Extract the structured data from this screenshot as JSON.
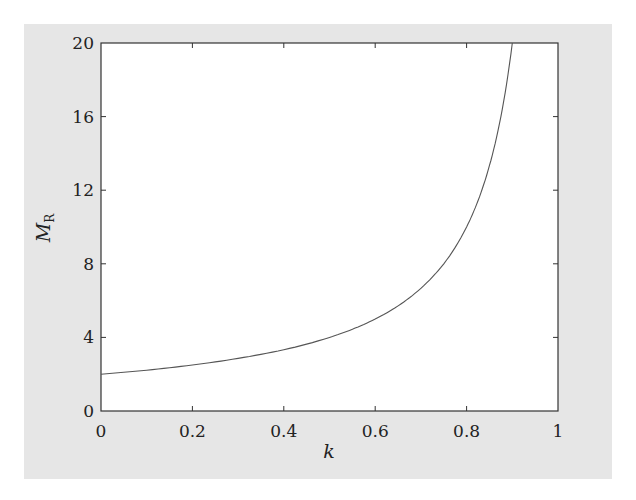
{
  "chart_data": {
    "type": "line",
    "title": "",
    "xlabel": "k",
    "ylabel": "M",
    "ylabel_subscript": "R",
    "xlim": [
      0,
      1
    ],
    "ylim": [
      0,
      20
    ],
    "x_ticks": [
      "0",
      "0.2",
      "0.4",
      "0.6",
      "0.8",
      "1"
    ],
    "y_ticks": [
      "0",
      "4",
      "8",
      "12",
      "16",
      "20"
    ],
    "grid": false,
    "legend": null,
    "series": [
      {
        "name": "M_R",
        "x": [
          0,
          0.1,
          0.2,
          0.3,
          0.4,
          0.5,
          0.55,
          0.6,
          0.65,
          0.7,
          0.75,
          0.8,
          0.825,
          0.85,
          0.875,
          0.9
        ],
        "values": [
          2.0,
          2.22,
          2.5,
          2.86,
          3.33,
          4.0,
          4.44,
          5.0,
          5.71,
          6.67,
          8.0,
          10.0,
          11.43,
          13.33,
          16.0,
          20.0
        ]
      }
    ]
  },
  "colors": {
    "background": "#e6e6e6",
    "plot_area": "#ffffff",
    "line": "#555555",
    "axis": "#333333"
  }
}
